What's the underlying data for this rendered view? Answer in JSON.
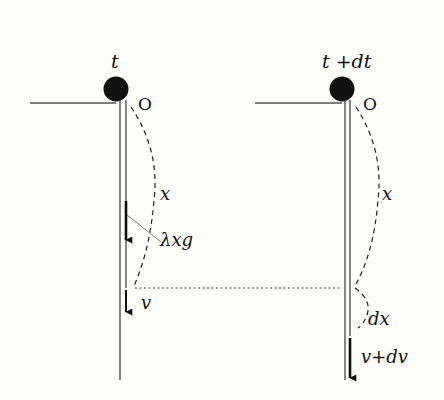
{
  "diagram": {
    "type": "physics-falling-chain",
    "colors": {
      "background": "#fcfcf9",
      "ink": "#111111",
      "line": "#555555"
    },
    "left_state": {
      "time_label": "t",
      "origin_label": "O",
      "length_label": "x",
      "force_label": "λxg",
      "velocity_label": "v"
    },
    "right_state": {
      "time_label": "t +dt",
      "origin_label": "O",
      "length_label": "x",
      "increment_label": "dx",
      "velocity_label": "v+dv"
    }
  }
}
